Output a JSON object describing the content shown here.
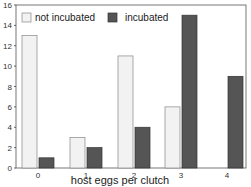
{
  "chart_data": {
    "type": "bar",
    "title": "",
    "xlabel": "host eggs per clutch",
    "ylabel": "",
    "categories": [
      "0",
      "1",
      "2",
      "3",
      "4"
    ],
    "series": [
      {
        "name": "not incubated",
        "values": [
          13,
          3,
          11,
          6,
          0
        ],
        "color": "#f2f2f2"
      },
      {
        "name": "incubated",
        "values": [
          1,
          2,
          4,
          15,
          9
        ],
        "color": "#555555"
      }
    ],
    "ylim": [
      0,
      16
    ],
    "yticks": [
      0,
      2,
      4,
      6,
      8,
      10,
      12,
      14,
      16
    ],
    "legend_position": "top-left",
    "grid": false
  }
}
